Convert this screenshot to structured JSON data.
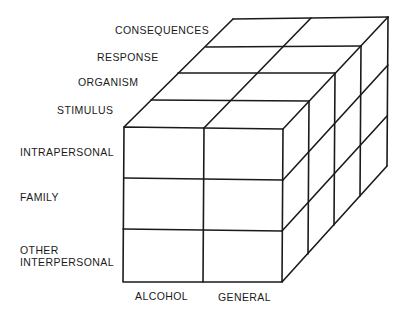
{
  "diagram": {
    "type": "3d-cube-matrix",
    "colors": {
      "background": "#ffffff",
      "line": "#1a1a1a",
      "text": "#1a1a1a"
    },
    "depth_labels": [
      {
        "id": "consequences",
        "text": "CONSEQUENCES"
      },
      {
        "id": "response",
        "text": "RESPONSE"
      },
      {
        "id": "organism",
        "text": "ORGANISM"
      },
      {
        "id": "stimulus",
        "text": "STIMULUS"
      }
    ],
    "row_labels": [
      {
        "id": "intrapersonal",
        "text": "INTRAPERSONAL"
      },
      {
        "id": "family",
        "text": "FAMILY"
      },
      {
        "id": "other-interpersonal",
        "text": "OTHER\nINTERPERSONAL"
      }
    ],
    "column_labels": [
      {
        "id": "alcohol",
        "text": "ALCOHOL"
      },
      {
        "id": "general",
        "text": "GENERAL"
      }
    ],
    "dimensions": {
      "columns": 2,
      "rows": 3,
      "depth": 4
    }
  }
}
